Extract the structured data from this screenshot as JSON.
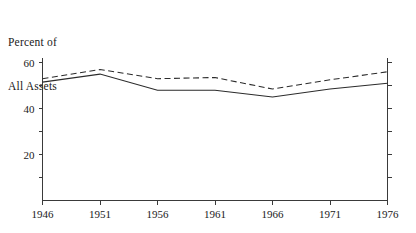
{
  "chart_data": {
    "type": "line",
    "title": "",
    "ylabel": "Percent of\nAll Assets",
    "ylabel_line1": "Percent of",
    "ylabel_line2": "All Assets",
    "xlabel": "",
    "x": [
      1946,
      1951,
      1956,
      1961,
      1966,
      1971,
      1976
    ],
    "categories": [
      "1946",
      "1951",
      "1956",
      "1961",
      "1966",
      "1971",
      "1976"
    ],
    "series": [
      {
        "name": "dashed-series",
        "style": "dashed",
        "values": [
          53.0,
          57.0,
          53.0,
          53.5,
          48.5,
          52.5,
          56.0
        ]
      },
      {
        "name": "solid-series",
        "style": "solid",
        "values": [
          51.5,
          55.0,
          48.0,
          48.0,
          45.0,
          48.5,
          51.0
        ]
      }
    ],
    "ylim": [
      0,
      62
    ],
    "xlim": [
      1946,
      1976
    ],
    "y_major_ticks": [
      20,
      40,
      60
    ],
    "y_major_tick_labels": [
      "20",
      "40",
      "60"
    ],
    "y_minor_ticks": [
      10,
      30,
      50
    ],
    "x_ticks": [
      1946,
      1951,
      1956,
      1961,
      1966,
      1971,
      1976
    ],
    "grid": false,
    "legend": "none",
    "right_axis": true,
    "line_color": "#2b2b2b",
    "axis_color": "#3a3a3a",
    "background": "#ffffff"
  }
}
